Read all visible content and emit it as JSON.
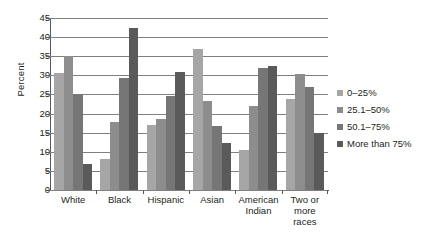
{
  "chart_data": {
    "type": "bar",
    "title": "",
    "subtitle": "",
    "xlabel": "",
    "ylabel": "Percent",
    "ylim": [
      0,
      45
    ],
    "ytick_step": 5,
    "yticks": [
      45,
      40,
      35,
      30,
      25,
      20,
      15,
      10,
      5,
      0
    ],
    "grid": true,
    "legend_position": "right",
    "categories": [
      "White",
      "Black",
      "Hispanic",
      "Asian",
      "American Indian",
      "Two or more races"
    ],
    "series": [
      {
        "name": "0–25%",
        "color": "#a6a6a6",
        "values": [
          30.5,
          8.0,
          17.0,
          37.0,
          10.5,
          23.7
        ]
      },
      {
        "name": "25.1–50%",
        "color": "#8d8d8d",
        "values": [
          35.0,
          17.8,
          18.6,
          23.4,
          22.1,
          30.3
        ]
      },
      {
        "name": "50.1–75%",
        "color": "#767676",
        "values": [
          25.0,
          29.3,
          24.5,
          16.8,
          31.9,
          27.0
        ]
      },
      {
        "name": "More than 75%",
        "color": "#5a5a5a",
        "values": [
          6.7,
          42.3,
          30.8,
          12.2,
          32.5,
          15.0
        ]
      }
    ]
  },
  "axis": {
    "y_title": "Percent"
  },
  "x_labels": [
    {
      "lines": [
        "White"
      ]
    },
    {
      "lines": [
        "Black"
      ]
    },
    {
      "lines": [
        "Hispanic"
      ]
    },
    {
      "lines": [
        "Asian"
      ]
    },
    {
      "lines": [
        "American",
        "Indian"
      ]
    },
    {
      "lines": [
        "Two or",
        "more",
        "races"
      ]
    }
  ],
  "legend": {
    "items": [
      {
        "label": "0–25%",
        "color": "#a6a6a6"
      },
      {
        "label": "25.1–50%",
        "color": "#8d8d8d"
      },
      {
        "label": "50.1–75%",
        "color": "#767676"
      },
      {
        "label": "More than 75%",
        "color": "#5a5a5a"
      }
    ]
  }
}
